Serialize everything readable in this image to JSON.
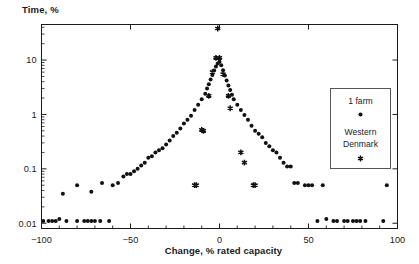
{
  "chart_data": {
    "type": "scatter",
    "title": "",
    "ylabel": "Time, %",
    "xlabel": "Change, % rated capacity",
    "xlim": [
      -100,
      100
    ],
    "ylim": [
      0.008,
      45
    ],
    "yscale": "log",
    "grid": false,
    "xticks": [
      -100,
      -50,
      0,
      50,
      100
    ],
    "xtick_labels": [
      "−100",
      "−50",
      "0",
      "50",
      "100"
    ],
    "yticks": [
      0.01,
      0.1,
      1,
      10
    ],
    "ytick_labels": [
      "0.01",
      "0.1",
      "1",
      "10"
    ],
    "legend": {
      "position": "upper-right",
      "entries": [
        {
          "name": "1 farm",
          "marker": "circle"
        },
        {
          "name": "Western Denmark",
          "marker": "star"
        }
      ]
    },
    "series": [
      {
        "name": "1 farm",
        "marker": "circle",
        "points": [
          [
            -99,
            0.011
          ],
          [
            -96,
            0.011
          ],
          [
            -94,
            0.011
          ],
          [
            -92,
            0.011
          ],
          [
            -90,
            0.012
          ],
          [
            -86,
            0.011
          ],
          [
            -80,
            0.011
          ],
          [
            -76,
            0.011
          ],
          [
            -74,
            0.011
          ],
          [
            -72,
            0.011
          ],
          [
            -70,
            0.011
          ],
          [
            -67,
            0.011
          ],
          [
            -62,
            0.011
          ],
          [
            -88,
            0.035
          ],
          [
            -80,
            0.05
          ],
          [
            -72,
            0.038
          ],
          [
            -66,
            0.055
          ],
          [
            -60,
            0.05
          ],
          [
            -57,
            0.055
          ],
          [
            -54,
            0.072
          ],
          [
            -52,
            0.08
          ],
          [
            -50,
            0.08
          ],
          [
            -48,
            0.09
          ],
          [
            -46,
            0.1
          ],
          [
            -44,
            0.115
          ],
          [
            -42,
            0.13
          ],
          [
            -40,
            0.16
          ],
          [
            -38,
            0.17
          ],
          [
            -36,
            0.2
          ],
          [
            -34,
            0.22
          ],
          [
            -32,
            0.24
          ],
          [
            -30,
            0.28
          ],
          [
            -28,
            0.33
          ],
          [
            -26,
            0.4
          ],
          [
            -24,
            0.46
          ],
          [
            -22,
            0.55
          ],
          [
            -20,
            0.68
          ],
          [
            -18,
            0.8
          ],
          [
            -16,
            0.95
          ],
          [
            -14,
            1.2
          ],
          [
            -12,
            1.5
          ],
          [
            -10,
            1.9
          ],
          [
            -8,
            2.4
          ],
          [
            -7,
            3.0
          ],
          [
            -6,
            3.6
          ],
          [
            -5,
            4.4
          ],
          [
            -4,
            5.3
          ],
          [
            -3,
            6.4
          ],
          [
            -2,
            7.6
          ],
          [
            -1,
            8.6
          ],
          [
            0,
            9.3
          ],
          [
            1,
            8.0
          ],
          [
            2,
            6.5
          ],
          [
            3,
            5.2
          ],
          [
            4,
            4.2
          ],
          [
            5,
            3.4
          ],
          [
            6,
            2.8
          ],
          [
            7,
            2.3
          ],
          [
            8,
            1.9
          ],
          [
            10,
            1.5
          ],
          [
            12,
            1.2
          ],
          [
            14,
            0.98
          ],
          [
            16,
            0.8
          ],
          [
            18,
            0.62
          ],
          [
            20,
            0.5
          ],
          [
            22,
            0.44
          ],
          [
            24,
            0.38
          ],
          [
            26,
            0.3
          ],
          [
            28,
            0.26
          ],
          [
            30,
            0.22
          ],
          [
            32,
            0.2
          ],
          [
            34,
            0.16
          ],
          [
            36,
            0.13
          ],
          [
            38,
            0.11
          ],
          [
            40,
            0.11
          ],
          [
            42,
            0.055
          ],
          [
            44,
            0.055
          ],
          [
            48,
            0.05
          ],
          [
            50,
            0.05
          ],
          [
            52,
            0.05
          ],
          [
            58,
            0.05
          ],
          [
            55,
            0.011
          ],
          [
            60,
            0.012
          ],
          [
            64,
            0.011
          ],
          [
            66,
            0.011
          ],
          [
            70,
            0.011
          ],
          [
            72,
            0.011
          ],
          [
            75,
            0.011
          ],
          [
            77,
            0.011
          ],
          [
            79,
            0.011
          ],
          [
            82,
            0.011
          ],
          [
            92,
            0.011
          ],
          [
            94,
            0.05
          ]
        ]
      },
      {
        "name": "Western Denmark",
        "marker": "star",
        "points": [
          [
            -1,
            38.0
          ],
          [
            -2,
            11.0
          ],
          [
            0,
            11.0
          ],
          [
            -4,
            6.0
          ],
          [
            2,
            5.5
          ],
          [
            -6,
            2.2
          ],
          [
            5,
            2.2
          ],
          [
            6,
            1.3
          ],
          [
            -10,
            0.52
          ],
          [
            -9,
            0.5
          ],
          [
            12,
            0.2
          ],
          [
            14,
            0.13
          ],
          [
            -14,
            0.05
          ],
          [
            -13,
            0.05
          ],
          [
            19,
            0.05
          ],
          [
            20,
            0.05
          ]
        ]
      }
    ]
  },
  "axes": {
    "y_title": "Time, %",
    "x_title": "Change, % rated capacity"
  }
}
